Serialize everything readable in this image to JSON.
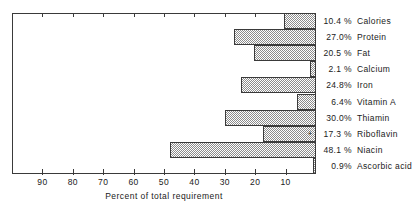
{
  "chart_data": {
    "type": "bar",
    "orientation": "horizontal",
    "title": "",
    "xlabel": "Percent of total requirement",
    "ylabel": "",
    "xlim": [
      0,
      100
    ],
    "x_axis_reversed": true,
    "grid": false,
    "legend": null,
    "x_ticks": [
      90,
      80,
      70,
      60,
      50,
      40,
      30,
      20,
      10
    ],
    "x_tick_labels": [
      "90",
      "80",
      "70",
      "60",
      "50",
      "40",
      "30",
      "20",
      "10"
    ],
    "categories": [
      "Calories",
      "Protein",
      "Fat",
      "Calcium",
      "Iron",
      "Vitamin A",
      "Thiamin",
      "Riboflavin",
      "Niacin",
      "Ascorbic acid"
    ],
    "values": [
      10.4,
      27.0,
      20.5,
      2.1,
      24.8,
      6.4,
      30.0,
      17.3,
      48.1,
      0.9
    ],
    "value_labels": [
      "10.4 %",
      "27.0%",
      "20.5 %",
      "2.1 %",
      "24.8%",
      "6.4%",
      "30.0%",
      "17.3 %",
      "48.1 %",
      "0.9%"
    ],
    "annotations": [
      {
        "category": "Riboflavin",
        "text": "+"
      }
    ]
  },
  "axis": {
    "x_title": "Percent of total requirement"
  },
  "colors": {
    "line": "#3a3a3a",
    "bar_fill": "#8c8c8c",
    "background": "#ffffff",
    "text": "#1a1a1a"
  }
}
